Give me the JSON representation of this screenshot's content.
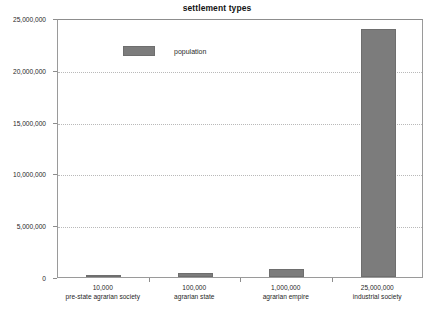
{
  "chart_data": {
    "type": "bar",
    "title": "settlement types",
    "xlabel": "",
    "ylabel": "",
    "categories": [
      "pre-state agrarian society",
      "agrarian state",
      "agrarian empire",
      "industrial society"
    ],
    "category_values": [
      "10,000",
      "100,000",
      "1,000,000",
      "25,000,000"
    ],
    "series": [
      {
        "name": "population",
        "values": [
          130000,
          400000,
          800000,
          23900000
        ],
        "color": "#7c7c7c"
      }
    ],
    "ylim": [
      0,
      25000000
    ],
    "ytick_labels": [
      "0",
      "5,000,000",
      "10,000,000",
      "15,000,000",
      "20,000,000",
      "25,000,000"
    ],
    "ytick_values": [
      0,
      5000000,
      10000000,
      15000000,
      20000000,
      25000000
    ],
    "grid": true,
    "grid_style": "dotted-horizontal",
    "legend": {
      "position": "top-left-inside",
      "entries": [
        {
          "label": "population",
          "color": "#7c7c7c"
        }
      ]
    },
    "axis_color": "#8d8d8d",
    "gridline_color": "#b9b9b9",
    "background_color": "#ffffff"
  }
}
